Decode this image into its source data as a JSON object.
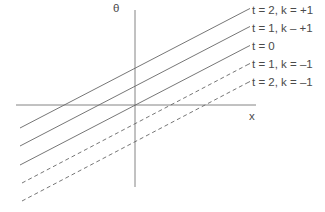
{
  "diagram": {
    "axes": {
      "vertical_label": "θ",
      "horizontal_label": "x",
      "origin": [
        135,
        105
      ]
    },
    "lines": [
      {
        "label": "t = 2, k = +1",
        "style": "solid",
        "left": [
          20,
          128
        ],
        "right": [
          247,
          10
        ]
      },
      {
        "label": "t = 1, k – +1",
        "style": "solid",
        "left": [
          20,
          146
        ],
        "right": [
          247,
          28
        ]
      },
      {
        "label": "t = 0",
        "style": "solid",
        "left": [
          20,
          165
        ],
        "right": [
          247,
          47
        ]
      },
      {
        "label": "t = 1, k = –1",
        "style": "dashed",
        "left": [
          22,
          183
        ],
        "right": [
          247,
          65
        ]
      },
      {
        "label": "t = 2, k = –1",
        "style": "dashed",
        "left": [
          22,
          201
        ],
        "right": [
          247,
          83
        ]
      }
    ],
    "colors": {
      "axis": "#777777",
      "line": "#666666",
      "text": "#4a4a4a"
    }
  }
}
